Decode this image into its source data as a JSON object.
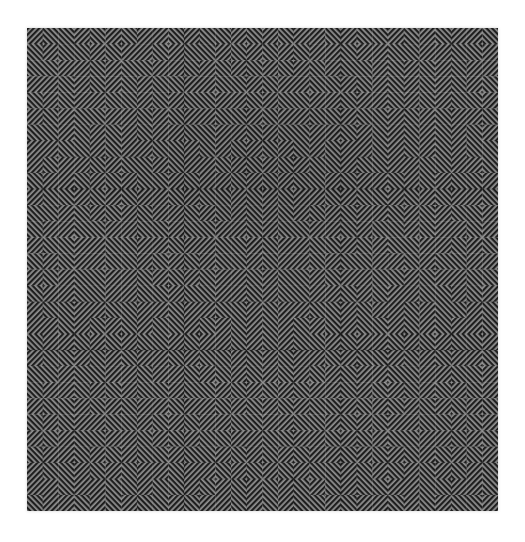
{
  "artwork": {
    "kind": "op-art-diagonal-stripe-maze",
    "panel_layout": "3x3-grid-of-square-panels",
    "colors": {
      "page_background": "#ffffff",
      "stripe_dark": "#1e1e1e",
      "stripe_light": "#8f8f8f",
      "seam": "rgba(0,0,0,0.22)"
    },
    "geometry": {
      "left": 27,
      "top": 28,
      "width": 471,
      "height": 483,
      "panels_per_side": 3,
      "tiles_per_panel": 10,
      "tile_size": 16,
      "panel_size": 160,
      "stripe_period": 4,
      "stripe_dark_width": 2.2
    },
    "legend": {
      "A": "stripes-running-bottomleft-to-topright",
      "B": "stripes-running-topleft-to-bottomright"
    },
    "panel_grids": [
      [
        "ABBAB",
        "BABBA",
        "BBAAB",
        "AABAB",
        "BABAA"
      ],
      [
        "ABBAB",
        "BBABA",
        "BABAB",
        "AABBA",
        "BBAAB"
      ],
      [
        "ABBAB",
        "BAABB",
        "BBABA",
        "ABABA",
        "BAABA"
      ],
      [
        "ABBAB",
        "BBABA",
        "BAABB",
        "ABBAA",
        "BABAA"
      ],
      [
        "ABBAB",
        "BABAB",
        "BBAAB",
        "AABBA",
        "BABBA"
      ],
      [
        "ABBAB",
        "BAABA",
        "BABBA",
        "ABABB",
        "BBAAB"
      ],
      [
        "ABBAB",
        "BBABB",
        "BAABA",
        "ABBAB",
        "BABAA"
      ],
      [
        "ABBAB",
        "BABAB",
        "BBABA",
        "AABAB",
        "BAABB"
      ],
      [
        "ABBAB",
        "BAABB",
        "BABAB",
        "ABABA",
        "BABAA"
      ]
    ]
  }
}
